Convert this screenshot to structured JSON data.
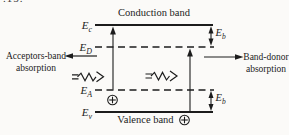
{
  "figure": {
    "fragment": ".15."
  },
  "bands": {
    "conduction_label": "Conduction band",
    "valence_label": "Valence band"
  },
  "levels": {
    "ec": {
      "base": "E",
      "sub": "c"
    },
    "ed": {
      "base": "E",
      "sub": "D"
    },
    "ea": {
      "base": "E",
      "sub": "A"
    },
    "ev": {
      "base": "E",
      "sub": "v"
    }
  },
  "binding_energy": {
    "base": "E",
    "sub": "b"
  },
  "annotations": {
    "acceptors": {
      "line1": "Acceptors-band",
      "line2": "absorption"
    },
    "donor": {
      "line1": "Band-donor",
      "line2": "absorption"
    }
  },
  "colors": {
    "ink": "#1c1c1c",
    "paper": "#fbfaf8"
  }
}
